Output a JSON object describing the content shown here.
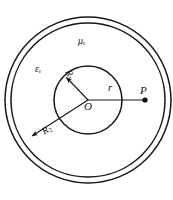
{
  "figure": {
    "background_color": "#ffffff",
    "stroke_color": "#17161a",
    "center": {
      "label": "O",
      "x": 88,
      "y": 100
    },
    "circles": [
      {
        "name": "outer-boundary-outer",
        "radius": 83,
        "style": "solid"
      },
      {
        "name": "outer-boundary-inner",
        "radius": 77,
        "style": "solid"
      },
      {
        "name": "inner-boundary",
        "radius": 34,
        "style": "solid"
      }
    ],
    "labels": {
      "mu_r": "μ",
      "mu_r_sub": "r",
      "eps_r": "ε",
      "eps_r_sub": "r",
      "radius_r": "r",
      "center": "O",
      "point_p": "P",
      "R1": "R",
      "R1_sub": "1",
      "R2": "R",
      "R2_sub": "2"
    },
    "point_p": {
      "label": "P",
      "x": 145,
      "y": 100,
      "marker": "filled-dot"
    },
    "radius_vectors": [
      {
        "name": "r-to-P",
        "label": "r",
        "from": "O",
        "to_x": 145,
        "to_y": 100,
        "arrow": false
      },
      {
        "name": "R1-inner",
        "label": "R1",
        "from": "O",
        "to_x": 64,
        "to_y": 76,
        "arrow": true
      },
      {
        "name": "R2-outer",
        "label": "R2",
        "from": "O",
        "to_x": 30,
        "to_y": 138,
        "arrow": true
      }
    ]
  }
}
